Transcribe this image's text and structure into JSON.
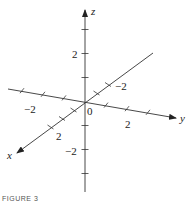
{
  "diagram": {
    "type": "3d-coordinate-axes",
    "axes": [
      {
        "name": "x",
        "label": "x",
        "tick_values": [
          -2,
          -1,
          1,
          2,
          3
        ],
        "labeled_ticks": [
          {
            "value": 2,
            "text": "2"
          }
        ]
      },
      {
        "name": "y",
        "label": "y",
        "tick_values": [
          -3,
          -2,
          -1,
          1,
          2,
          3
        ],
        "labeled_ticks": [
          {
            "value": -2,
            "text": "−2"
          },
          {
            "value": 2,
            "text": "2"
          }
        ]
      },
      {
        "name": "z",
        "label": "z",
        "tick_values": [
          -3,
          -2,
          -1,
          1,
          2,
          3
        ],
        "labeled_ticks": [
          {
            "value": 2,
            "text": "2"
          },
          {
            "value": -2,
            "text": "−2"
          }
        ]
      }
    ],
    "origin_label": "0",
    "x_negative_label": "−2"
  },
  "caption": "FIGURE 3"
}
